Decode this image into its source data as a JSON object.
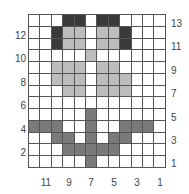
{
  "chart_data": {
    "type": "heatmap",
    "title": "",
    "columns": 12,
    "rows": 13,
    "legend": {
      "0": "#ffffff",
      "1": "#bdbdbd",
      "2": "#7a7a7a",
      "3": "#3a3a3a"
    },
    "row_labels_left": [
      "12",
      "10",
      "8",
      "6",
      "4",
      "2"
    ],
    "row_labels_right": [
      "13",
      "11",
      "9",
      "7",
      "5",
      "3",
      "1"
    ],
    "column_labels_bottom": [
      "11",
      "9",
      "7",
      "5",
      "3",
      "1"
    ],
    "grid_top_to_bottom": [
      [
        0,
        0,
        0,
        3,
        3,
        0,
        3,
        3,
        0,
        0,
        0,
        0
      ],
      [
        0,
        0,
        3,
        1,
        1,
        0,
        1,
        1,
        3,
        0,
        0,
        0
      ],
      [
        0,
        0,
        3,
        1,
        1,
        0,
        1,
        1,
        3,
        0,
        0,
        0
      ],
      [
        0,
        0,
        0,
        0,
        0,
        1,
        0,
        0,
        0,
        0,
        0,
        0
      ],
      [
        0,
        0,
        1,
        1,
        1,
        0,
        1,
        1,
        0,
        0,
        0,
        0
      ],
      [
        0,
        0,
        1,
        1,
        1,
        0,
        1,
        1,
        1,
        0,
        0,
        0
      ],
      [
        0,
        0,
        0,
        1,
        1,
        0,
        1,
        1,
        1,
        0,
        0,
        0
      ],
      [
        0,
        0,
        0,
        0,
        0,
        0,
        0,
        0,
        0,
        0,
        0,
        0
      ],
      [
        0,
        0,
        0,
        0,
        0,
        2,
        0,
        0,
        0,
        0,
        0,
        0
      ],
      [
        2,
        2,
        2,
        0,
        0,
        2,
        0,
        0,
        2,
        2,
        2,
        0
      ],
      [
        0,
        0,
        2,
        2,
        0,
        2,
        0,
        2,
        2,
        0,
        0,
        0
      ],
      [
        0,
        0,
        0,
        2,
        2,
        2,
        2,
        2,
        0,
        0,
        0,
        0
      ],
      [
        0,
        0,
        0,
        0,
        0,
        2,
        0,
        0,
        0,
        0,
        0,
        0
      ]
    ]
  }
}
